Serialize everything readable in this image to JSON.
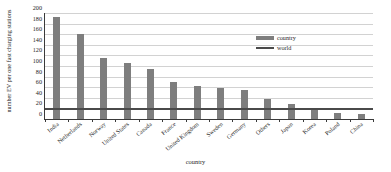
{
  "chart_data": {
    "type": "bar",
    "title": "",
    "subtitle": "",
    "xlabel": "country",
    "ylabel": "number EV per one fast charging stations",
    "categories": [
      "India",
      "Netherlands",
      "Norway",
      "United States",
      "Canada",
      "France",
      "United Kingdom",
      "Sweden",
      "Germany",
      "Others",
      "Japan",
      "Korea",
      "Poland",
      "China"
    ],
    "values": [
      192,
      160,
      116,
      106,
      95,
      70,
      62,
      59,
      55,
      38,
      28,
      18,
      12,
      10
    ],
    "series": [
      {
        "name": "country",
        "type": "bar",
        "values": [
          192,
          160,
          116,
          106,
          95,
          70,
          62,
          59,
          55,
          38,
          28,
          18,
          12,
          10
        ],
        "color": "#7e7e7e"
      },
      {
        "name": "world",
        "type": "reference-line",
        "value": 20,
        "color": "#4a4a4a"
      }
    ],
    "ylim": [
      0,
      200
    ],
    "yticks": [
      0,
      20,
      40,
      60,
      80,
      100,
      120,
      140,
      160,
      180,
      200
    ],
    "ytick_labels": [
      "0",
      "20",
      "40",
      "60",
      "80",
      "100",
      "120",
      "140",
      "160",
      "180",
      "200"
    ],
    "grid": true,
    "grid_axis": "y",
    "legend_position": "upper-right",
    "legend_entries": [
      {
        "label": "country",
        "marker": "bar-swatch",
        "color": "#7e7e7e"
      },
      {
        "label": "world",
        "marker": "line-swatch",
        "color": "#4a4a4a"
      }
    ],
    "background_color": "#ffffff",
    "axis_color": "#3a3a3a",
    "gridline_color": "#d2d2d2"
  }
}
